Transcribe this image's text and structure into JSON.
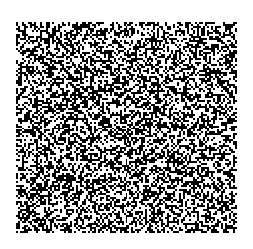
{
  "image": {
    "width": 253,
    "height": 249,
    "background": "#ffffff",
    "pattern": {
      "type": "binary-random-noise",
      "x": 16,
      "y": 22,
      "width": 221,
      "height": 211,
      "cell_size": 2,
      "foreground": "#000000",
      "background": "#ffffff",
      "density": 0.5,
      "seed": 1337
    }
  }
}
